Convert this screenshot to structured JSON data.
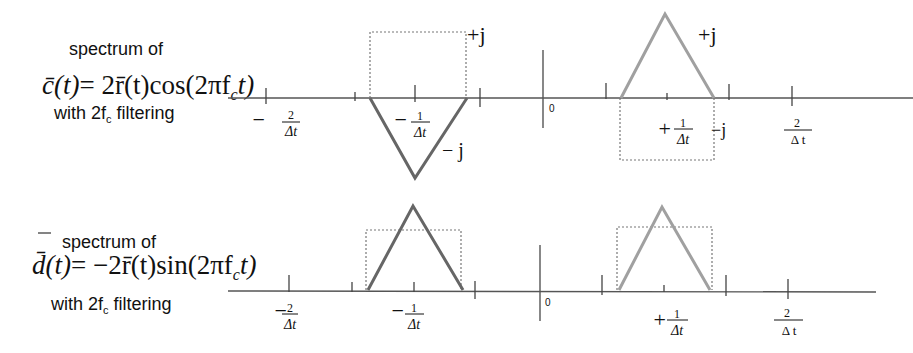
{
  "panels": [
    {
      "caption_line1": "spectrum of",
      "formula": {
        "lhs": "c̄(t)",
        "rhs": "= 2r̄(t)cos(2πf",
        "sub": "c",
        "tail": "t)"
      },
      "caption_line3_pre": "with 2f",
      "caption_line3_sub": "c",
      "caption_line3_post": " filtering",
      "tick_labels": {
        "neg2_sign": "−",
        "neg2_num": "2",
        "neg2_den": "Δt",
        "neg1_sign": "−",
        "neg1_num": "1",
        "neg1_den": "Δt",
        "zero": "0",
        "pos1_sign": "+",
        "pos1_num": "1",
        "pos1_den": "Δt",
        "pos2_num": "2",
        "pos2_den": "Δ t"
      },
      "annotations": {
        "left_box": "+j",
        "left_triangle": "− j",
        "right_triangle": "+j",
        "right_box": "−j"
      }
    },
    {
      "caption_line1": "spectrum of",
      "formula": {
        "lhs": "d̄(t)",
        "rhs": "= −2r̄(t)sin(2πf",
        "sub": "c",
        "tail": "t)"
      },
      "caption_line3_pre": "with 2f",
      "caption_line3_sub": "c",
      "caption_line3_post": " filtering",
      "tick_labels": {
        "neg2_sign": "−",
        "neg2_num": "2",
        "neg2_den": "Δt",
        "neg1_sign": "−",
        "neg1_num": "1",
        "neg1_den": "Δt",
        "zero": "0",
        "pos1_sign": "+",
        "pos1_num": "1",
        "pos1_den": "Δt",
        "pos2_num": "2",
        "pos2_den": "Δ t"
      }
    }
  ],
  "colors": {
    "negative_freq_triangle": "#666666",
    "positive_freq_triangle": "#a0a0a0",
    "dotted_box": "#777777",
    "axis": "#555555"
  }
}
